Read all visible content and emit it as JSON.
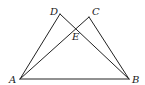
{
  "figure": {
    "points": {
      "A": {
        "label": "A",
        "x": 20,
        "y": 79,
        "lx": 9,
        "ly": 83
      },
      "B": {
        "label": "B",
        "x": 129,
        "y": 79,
        "lx": 132,
        "ly": 83
      },
      "C": {
        "label": "C",
        "x": 89,
        "y": 17,
        "lx": 92,
        "ly": 15
      },
      "D": {
        "label": "D",
        "x": 60,
        "y": 14,
        "lx": 50,
        "ly": 15
      },
      "E": {
        "label": "E",
        "x": 76,
        "y": 29,
        "lx": 72,
        "ly": 40
      }
    },
    "segments": [
      [
        "A",
        "B"
      ],
      [
        "A",
        "D"
      ],
      [
        "D",
        "B"
      ],
      [
        "A",
        "C"
      ],
      [
        "C",
        "B"
      ]
    ]
  }
}
